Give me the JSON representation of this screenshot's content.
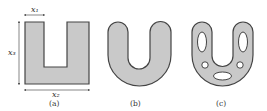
{
  "figure": {
    "panels": [
      {
        "id": "a",
        "caption": "(a)",
        "description": "rectangular U-shape with dimensions"
      },
      {
        "id": "b",
        "caption": "(b)",
        "description": "rounded U-shape"
      },
      {
        "id": "c",
        "caption": "(c)",
        "description": "rounded U-shape with holes"
      }
    ],
    "dimensions": {
      "top": "x₁",
      "left": "x₃",
      "bottom": "x₂"
    },
    "colors": {
      "fill": "#c9c9c9",
      "stroke": "#444444",
      "background": "#ffffff"
    }
  }
}
